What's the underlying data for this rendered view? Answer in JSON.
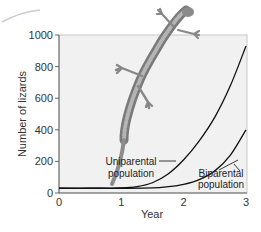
{
  "chart_data": {
    "type": "line",
    "title": "",
    "xlabel": "Year",
    "ylabel": "Number of lizards",
    "xlim": [
      0,
      3
    ],
    "ylim": [
      0,
      1000
    ],
    "x_ticks": [
      0,
      1,
      2,
      3
    ],
    "x_tick_labels": [
      "0",
      "1",
      "2",
      "3"
    ],
    "y_ticks": [
      0,
      200,
      400,
      600,
      800,
      1000
    ],
    "y_tick_labels": [
      "0",
      "200",
      "400",
      "600",
      "800",
      "1000"
    ],
    "grid": false,
    "series": [
      {
        "name": "Uniparental population",
        "x": [
          0,
          0.5,
          1.0,
          1.25,
          1.5,
          1.75,
          2.0,
          2.25,
          2.5,
          2.75,
          3.0
        ],
        "y": [
          30,
          30,
          32,
          40,
          65,
          120,
          210,
          330,
          480,
          680,
          930
        ],
        "color": "#111111"
      },
      {
        "name": "Biparental population",
        "x": [
          0,
          0.5,
          1.0,
          1.5,
          1.75,
          2.0,
          2.25,
          2.5,
          2.75,
          3.0
        ],
        "y": [
          30,
          30,
          30,
          32,
          40,
          55,
          85,
          140,
          240,
          400
        ],
        "color": "#111111"
      }
    ],
    "annotations": [
      {
        "text_lines": [
          "Uniparental",
          "population"
        ],
        "series": "Uniparental population"
      },
      {
        "text_lines": [
          "Biparental",
          "population"
        ],
        "series": "Biparental population"
      }
    ],
    "decoration": "lizard illustration overlapping top of plot"
  }
}
